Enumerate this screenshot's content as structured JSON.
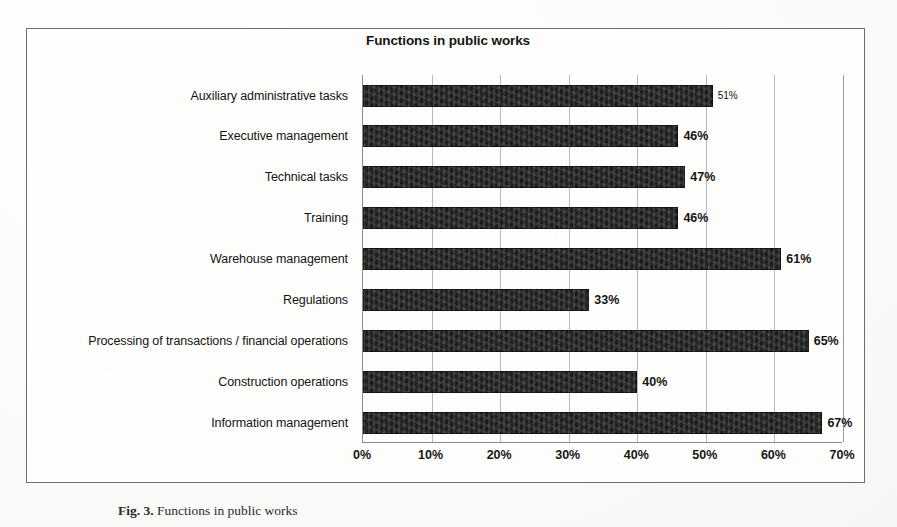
{
  "chart_data": {
    "type": "bar",
    "orientation": "horizontal",
    "title": "Functions in public works",
    "xlabel": "",
    "ylabel": "",
    "xlim": [
      0,
      70
    ],
    "grid": true,
    "legend": false,
    "xticks": [
      "0%",
      "10%",
      "20%",
      "30%",
      "40%",
      "50%",
      "60%",
      "70%"
    ],
    "xtick_values": [
      0,
      10,
      20,
      30,
      40,
      50,
      60,
      70
    ],
    "categories": [
      "Auxiliary administrative tasks",
      "Executive management",
      "Technical tasks",
      "Training",
      "Warehouse management",
      "Regulations",
      "Processing of transactions / financial operations",
      "Construction operations",
      "Information management"
    ],
    "values": [
      51,
      46,
      47,
      46,
      61,
      33,
      65,
      40,
      67
    ],
    "data_labels": [
      "51%",
      "46%",
      "47%",
      "46%",
      "61%",
      "33%",
      "65%",
      "40%",
      "67%"
    ],
    "bar_color": "#1c1c1c"
  },
  "caption": {
    "label": "Fig. 3.",
    "text": "Functions in public works"
  }
}
